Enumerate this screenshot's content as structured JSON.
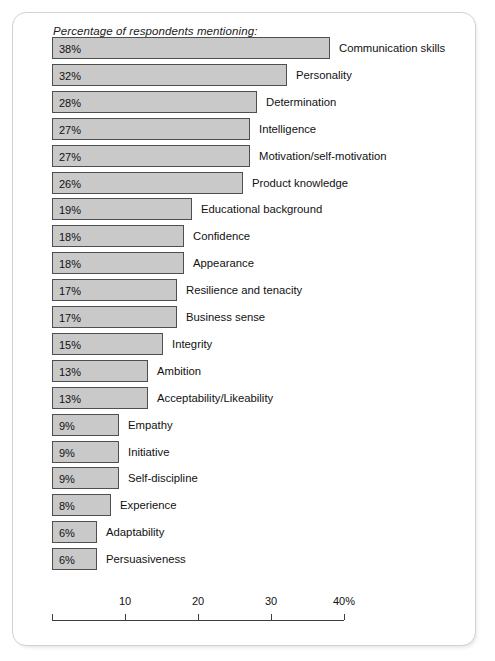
{
  "figure": {
    "title": "Percentage of respondents mentioning:"
  },
  "axis": {
    "ticks": [
      {
        "value": 10,
        "label": "10"
      },
      {
        "value": 20,
        "label": "20"
      },
      {
        "value": 30,
        "label": "30"
      },
      {
        "value": 40,
        "label": "40%"
      }
    ],
    "min": 0,
    "max": 40
  },
  "chart_data": {
    "type": "bar",
    "orientation": "horizontal",
    "title": "Percentage of respondents mentioning:",
    "xlabel": "40%",
    "ylabel": "",
    "xlim": [
      0,
      40
    ],
    "grid": false,
    "legend": false,
    "categories": [
      "Communication skills",
      "Personality",
      "Determination",
      "Intelligence",
      "Motivation/self-motivation",
      "Product knowledge",
      "Educational background",
      "Confidence",
      "Appearance",
      "Resilience and tenacity",
      "Business sense",
      "Integrity",
      "Ambition",
      "Acceptability/Likeability",
      "Empathy",
      "Initiative",
      "Self-discipline",
      "Experience",
      "Adaptability",
      "Persuasiveness"
    ],
    "values": [
      38,
      32,
      28,
      27,
      27,
      26,
      19,
      18,
      18,
      17,
      17,
      15,
      13,
      13,
      9,
      9,
      9,
      8,
      6,
      6
    ],
    "value_labels": [
      "38%",
      "32%",
      "28%",
      "27%",
      "27%",
      "26%",
      "19%",
      "18%",
      "18%",
      "17%",
      "17%",
      "15%",
      "13%",
      "13%",
      "9%",
      "9%",
      "9%",
      "8%",
      "6%",
      "6%"
    ],
    "bar_fill_color": "#c9c9c9",
    "bar_border_color": "#4f4f4f"
  }
}
